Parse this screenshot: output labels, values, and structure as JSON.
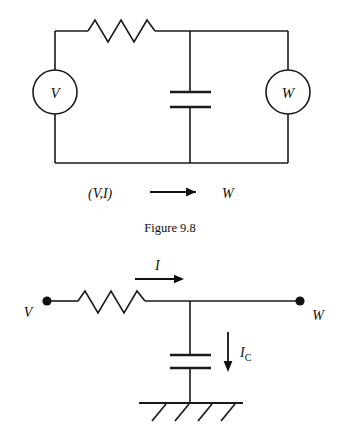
{
  "figure": {
    "caption": "Figure 9.8"
  },
  "top_circuit": {
    "name": "two-port-network-with-meters",
    "source_meter_label": "V",
    "load_meter_label": "W",
    "flow_source_label": "(V,I)",
    "flow_target_label": "W",
    "flow_arrow_icon": "right-arrow-icon",
    "components": {
      "resistor_label": "",
      "capacitor_label": ""
    }
  },
  "bottom_circuit": {
    "name": "rc-ladder-with-ground",
    "input_terminal_label": "V",
    "output_terminal_label": "W",
    "branch_current_label": "I",
    "branch_current_arrow_icon": "right-arrow-icon",
    "capacitor_current_label_main": "I",
    "capacitor_current_label_sub": "C",
    "capacitor_current_arrow_icon": "down-arrow-icon",
    "ground_icon": "ground-hatch-icon"
  },
  "colors": {
    "ink": "#1a1a1a",
    "text": "#111111",
    "background": "#ffffff"
  }
}
